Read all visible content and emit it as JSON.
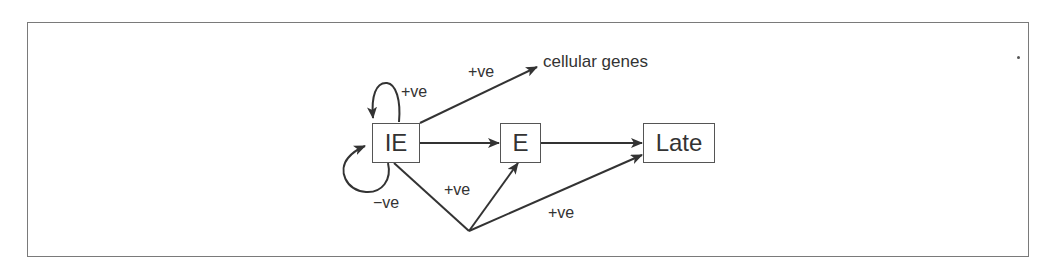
{
  "diagram": {
    "nodes": [
      {
        "id": "IE",
        "label": "IE"
      },
      {
        "id": "E",
        "label": "E"
      },
      {
        "id": "Late",
        "label": "Late"
      }
    ],
    "targets": {
      "cellular_genes": "cellular genes"
    },
    "edges": [
      {
        "from": "IE",
        "to": "IE",
        "label": "+ve",
        "kind": "self-loop-top"
      },
      {
        "from": "IE",
        "to": "IE",
        "label": "−ve",
        "kind": "self-loop-bottom"
      },
      {
        "from": "IE",
        "to": "cellular genes",
        "label": "+ve"
      },
      {
        "from": "IE",
        "to": "E",
        "label": ""
      },
      {
        "from": "E",
        "to": "Late",
        "label": ""
      },
      {
        "from": "IE",
        "to": "E",
        "label": "+ve",
        "kind": "via-branch"
      },
      {
        "from": "IE",
        "to": "Late",
        "label": "+ve",
        "kind": "via-branch"
      }
    ],
    "labels": {
      "loop_top": "+ve",
      "loop_bottom": "−ve",
      "to_cellular": "+ve",
      "branch_to_e": "+ve",
      "branch_to_late": "+ve"
    },
    "colors": {
      "stroke": "#333333",
      "frame": "#7a7a7a",
      "text": "#333333"
    }
  }
}
